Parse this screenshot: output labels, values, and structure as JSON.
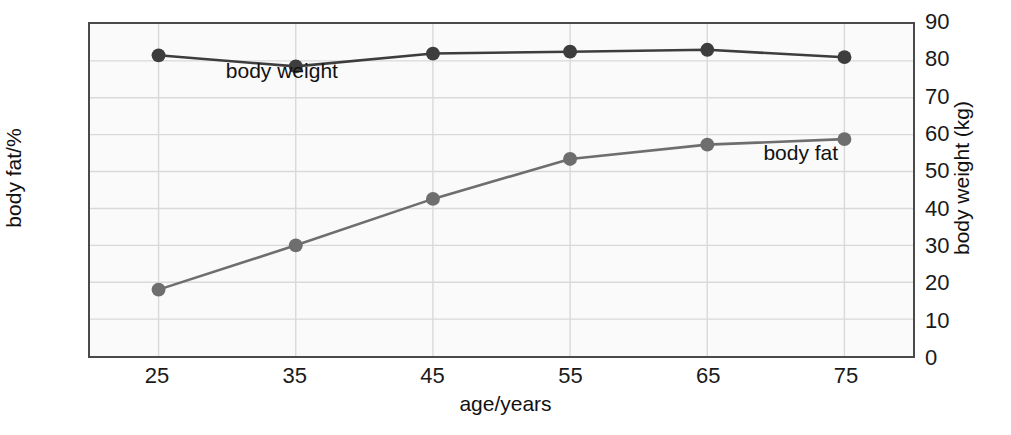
{
  "chart_data": {
    "type": "line",
    "title": "",
    "xlabel": "age/years",
    "ylabel": "body fat/%",
    "ylabel_right": "body weight (kg)",
    "x": [
      25,
      35,
      45,
      55,
      65,
      75
    ],
    "xtick_labels": [
      "25",
      "35",
      "45",
      "55",
      "65",
      "75"
    ],
    "xlim": [
      20,
      80
    ],
    "ylim": [
      10,
      40
    ],
    "ytick_labels": [
      "10",
      "20",
      "30",
      "40"
    ],
    "yticks": [
      10,
      20,
      30,
      40
    ],
    "ylim_right": [
      0,
      90
    ],
    "ytick_labels_right": [
      "0",
      "10",
      "20",
      "30",
      "40",
      "50",
      "60",
      "70",
      "80",
      "90"
    ],
    "yticks_right": [
      0,
      10,
      20,
      30,
      40,
      50,
      60,
      70,
      80,
      90
    ],
    "grid": true,
    "legend_position": "inline-annotations",
    "series": [
      {
        "name": "body fat",
        "axis": "left",
        "unit": "%",
        "color": "#6e6e6e",
        "label_text": "body fat",
        "values": [
          16.0,
          20.0,
          24.2,
          27.8,
          29.1,
          29.6
        ]
      },
      {
        "name": "body weight",
        "axis": "right",
        "unit": "kg",
        "color": "#3d3d3d",
        "label_text": "body weight",
        "values": [
          81.5,
          78.5,
          82.0,
          82.5,
          83.0,
          81.0
        ]
      }
    ],
    "annotations": [
      {
        "text": "body weight",
        "x": 30,
        "value": 35.6,
        "axis": "left"
      },
      {
        "text": "body fat",
        "x": 69,
        "value": 28.3,
        "axis": "left"
      }
    ]
  },
  "colors": {
    "plot_background": "#fafafa",
    "frame": "#4a4a4a",
    "gridline": "#d9d9d9",
    "text": "#111111"
  }
}
